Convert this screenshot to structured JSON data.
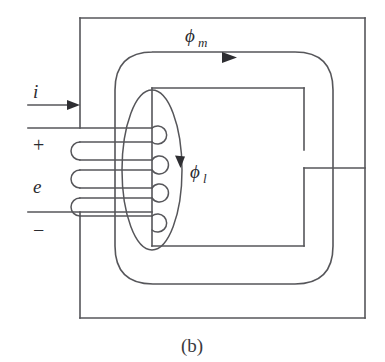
{
  "figure": {
    "caption": "(b)",
    "line_color": "#56565a",
    "arrow_color": "#2e2e32",
    "text_color": "#2b2b2f",
    "background": "#ffffff"
  },
  "labels": {
    "current": "i",
    "emf": "e",
    "positive_terminal": "+",
    "negative_terminal": "−",
    "main_flux": "ϕ",
    "main_flux_subscript": "m",
    "leakage_flux": "ϕ",
    "leakage_flux_subscript": "l"
  },
  "geometry": {
    "outer_core": {
      "x": 80,
      "y": 18,
      "width": 285,
      "height": 300
    },
    "inner_window": {
      "x": 152,
      "y": 88,
      "width": 152,
      "height": 158
    },
    "flux_loop": {
      "x": 115,
      "y": 52,
      "width": 218,
      "height": 232,
      "corner_radius": 38
    },
    "leakage_ellipse": {
      "cx": 152,
      "cy": 170,
      "rx": 30,
      "ry": 80
    },
    "air_gap": {
      "x": 304,
      "y": 150,
      "height": 18
    },
    "coil_turns_left": 3,
    "coil_turns_right": 4,
    "lead_top_y": 128,
    "lead_bottom_y": 212
  },
  "annotations": {
    "current_arrow_direction": "right",
    "main_flux_arrow_direction": "right",
    "leakage_flux_arrow_direction": "down"
  }
}
